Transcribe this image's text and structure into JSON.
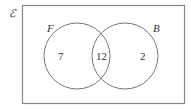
{
  "diagram": {
    "type": "venn",
    "universal_symbol": "ℰ",
    "sets": [
      {
        "name": "F",
        "only_count": "7"
      },
      {
        "name": "B",
        "only_count": "2"
      }
    ],
    "intersection_count": "12",
    "colors": {
      "stroke": "#777777",
      "text": "#333333"
    }
  }
}
